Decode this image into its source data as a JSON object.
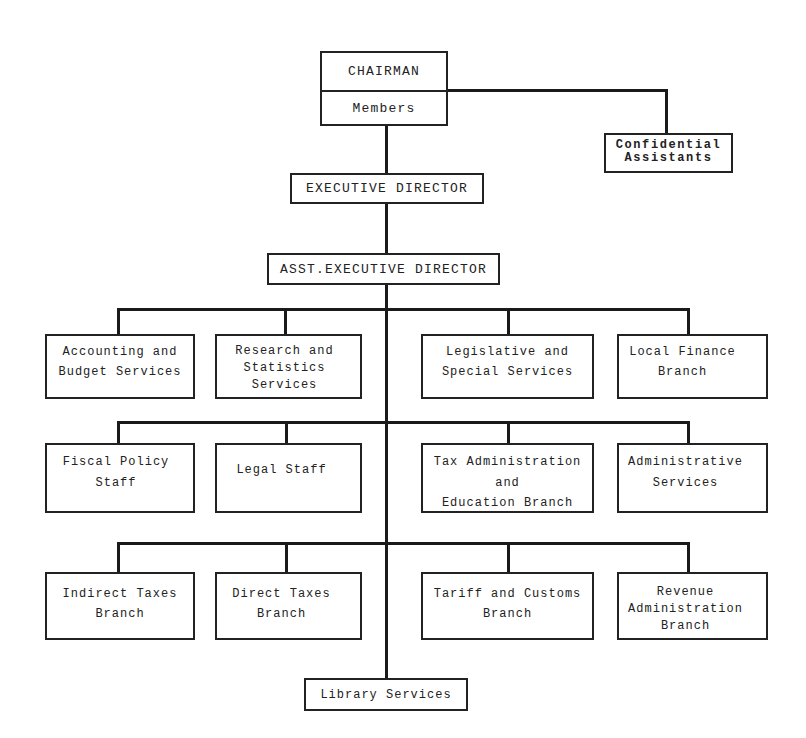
{
  "org_chart": {
    "chairman": {
      "label": "CHAIRMAN",
      "sub_label": "Members"
    },
    "confidential_assistants": {
      "lines": [
        "Confidential",
        "Assistants"
      ]
    },
    "executive_director": {
      "label": "EXECUTIVE DIRECTOR"
    },
    "asst_executive_director": {
      "label": "ASST.EXECUTIVE DIRECTOR"
    },
    "tiers": [
      {
        "units": [
          {
            "lines": [
              "Accounting and",
              "Budget Services"
            ]
          },
          {
            "lines": [
              "Research and",
              "Statistics",
              "Services"
            ]
          },
          {
            "lines": [
              "Legislative and",
              "Special Services"
            ]
          },
          {
            "lines": [
              "Local Finance",
              "Branch"
            ]
          }
        ]
      },
      {
        "units": [
          {
            "lines": [
              "Fiscal Policy",
              "Staff"
            ]
          },
          {
            "lines": [
              "Legal Staff"
            ]
          },
          {
            "lines": [
              "Tax Administration",
              "and",
              "Education Branch"
            ]
          },
          {
            "lines": [
              "Administrative",
              "Services"
            ]
          }
        ]
      },
      {
        "units": [
          {
            "lines": [
              "Indirect Taxes",
              "Branch"
            ]
          },
          {
            "lines": [
              "Direct Taxes",
              "Branch"
            ]
          },
          {
            "lines": [
              "Tariff and Customs",
              "Branch"
            ]
          },
          {
            "lines": [
              "Revenue",
              "Administration",
              "Branch"
            ]
          }
        ]
      }
    ],
    "library_services": {
      "label": "Library Services"
    },
    "reporting_lines": [
      {
        "from": "CHAIRMAN / Members",
        "to": "Confidential Assistants"
      },
      {
        "from": "CHAIRMAN / Members",
        "to": "EXECUTIVE DIRECTOR"
      },
      {
        "from": "EXECUTIVE DIRECTOR",
        "to": "ASST.EXECUTIVE DIRECTOR"
      },
      {
        "from": "ASST.EXECUTIVE DIRECTOR",
        "to": "Accounting and Budget Services"
      },
      {
        "from": "ASST.EXECUTIVE DIRECTOR",
        "to": "Research and Statistics Services"
      },
      {
        "from": "ASST.EXECUTIVE DIRECTOR",
        "to": "Legislative and Special Services"
      },
      {
        "from": "ASST.EXECUTIVE DIRECTOR",
        "to": "Local Finance Branch"
      },
      {
        "from": "ASST.EXECUTIVE DIRECTOR",
        "to": "Fiscal Policy Staff"
      },
      {
        "from": "ASST.EXECUTIVE DIRECTOR",
        "to": "Legal Staff"
      },
      {
        "from": "ASST.EXECUTIVE DIRECTOR",
        "to": "Tax Administration and Education Branch"
      },
      {
        "from": "ASST.EXECUTIVE DIRECTOR",
        "to": "Administrative Services"
      },
      {
        "from": "ASST.EXECUTIVE DIRECTOR",
        "to": "Indirect Taxes Branch"
      },
      {
        "from": "ASST.EXECUTIVE DIRECTOR",
        "to": "Direct Taxes Branch"
      },
      {
        "from": "ASST.EXECUTIVE DIRECTOR",
        "to": "Tariff and Customs Branch"
      },
      {
        "from": "ASST.EXECUTIVE DIRECTOR",
        "to": "Revenue Administration Branch"
      },
      {
        "from": "ASST.EXECUTIVE DIRECTOR",
        "to": "Library Services"
      }
    ]
  },
  "colors": {
    "background": "#ffffff",
    "box_border": "#222222",
    "connector": "#1a1a1a",
    "text": "#222222"
  }
}
